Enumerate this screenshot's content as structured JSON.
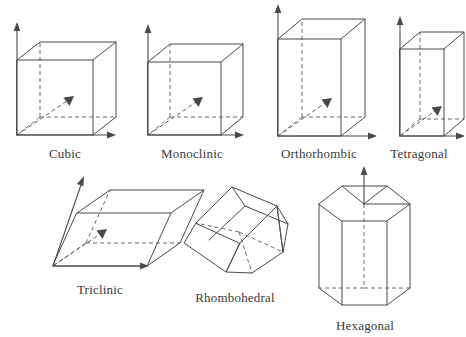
{
  "figure": {
    "background_color": "#ffffff",
    "line_color": "#4a4a4a",
    "hidden_line_color": "#6a6a6a",
    "label_color": "#3a3a3a"
  },
  "cells": [
    {
      "id": "cubic",
      "label": "Cubic",
      "shape": "cube",
      "row": 1,
      "has_axes": true,
      "label_x": 65,
      "label_y": 146
    },
    {
      "id": "monoclinic",
      "label": "Monoclinic",
      "shape": "box",
      "row": 1,
      "has_axes": true,
      "label_x": 192,
      "label_y": 146
    },
    {
      "id": "orthorhombic",
      "label": "Orthorhombic",
      "shape": "box-tall",
      "row": 1,
      "has_axes": true,
      "label_x": 318,
      "label_y": 146
    },
    {
      "id": "tetragonal",
      "label": "Tetragonal",
      "shape": "box-tall-narrow",
      "row": 1,
      "has_axes": true,
      "label_x": 421,
      "label_y": 146
    },
    {
      "id": "triclinic",
      "label": "Triclinic",
      "shape": "parallelepiped",
      "row": 2,
      "has_axes": true,
      "label_x": 100,
      "label_y": 282
    },
    {
      "id": "rhombohedral",
      "label": "Rhombohedral",
      "shape": "rhombohedron",
      "row": 2,
      "has_axes": false,
      "label_x": 235,
      "label_y": 290
    },
    {
      "id": "hexagonal",
      "label": "Hexagonal",
      "shape": "hexagonal-prism",
      "row": 2,
      "has_axes": true,
      "label_x": 365,
      "label_y": 319
    }
  ]
}
